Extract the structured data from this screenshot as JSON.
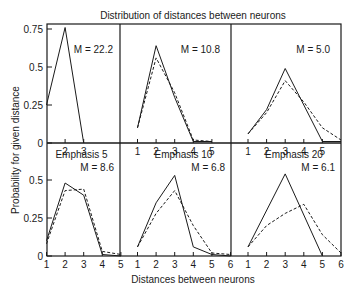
{
  "chart_data": {
    "type": "line",
    "title": "Distribution of distances between neurons",
    "xlabel": "Distances between neurons",
    "ylabel": "Probability for given distance",
    "layout": "2x3 grid of panels, shared axes, no gridlines, no legend",
    "series_styles": {
      "solid": "solid line",
      "dashed": "dashed line"
    },
    "panels": [
      {
        "id": "top-left",
        "row": 0,
        "col": 0,
        "label": "",
        "annotation": "M = 22.2",
        "x_ticks": [
          "2",
          "3"
        ],
        "x_range": [
          1,
          3
        ],
        "y_ticks": [
          "0",
          "0.25",
          "0.5",
          "0.75"
        ],
        "ylim": [
          0,
          0.75
        ],
        "series": [
          {
            "name": "solid",
            "x": [
              1,
              2,
              3
            ],
            "values": [
              0.25,
              0.76,
              0.0
            ]
          }
        ]
      },
      {
        "id": "top-middle",
        "row": 0,
        "col": 1,
        "label": "",
        "annotation": "M = 10.8",
        "x_ticks": [
          "1",
          "2",
          "3",
          "4",
          "5"
        ],
        "x_range": [
          0,
          6
        ],
        "ylim": [
          0,
          0.75
        ],
        "series": [
          {
            "name": "solid",
            "x": [
              1,
              2,
              3,
              4,
              5
            ],
            "values": [
              0.1,
              0.64,
              0.3,
              0.01,
              0.01
            ]
          },
          {
            "name": "dashed",
            "x": [
              1,
              2,
              3,
              4,
              5
            ],
            "values": [
              0.1,
              0.56,
              0.33,
              0.02,
              0.01
            ]
          }
        ]
      },
      {
        "id": "top-right",
        "row": 0,
        "col": 2,
        "label": "",
        "annotation": "M = 5.0",
        "x_ticks": [
          "1",
          "2",
          "3",
          "4",
          "5"
        ],
        "x_range": [
          0,
          6
        ],
        "ylim": [
          0,
          0.75
        ],
        "series": [
          {
            "name": "solid",
            "x": [
              1,
              2,
              3,
              4,
              5,
              6
            ],
            "values": [
              0.06,
              0.22,
              0.49,
              0.25,
              0.01,
              0.01
            ]
          },
          {
            "name": "dashed",
            "x": [
              1,
              2,
              3,
              4,
              5,
              6
            ],
            "values": [
              0.06,
              0.2,
              0.41,
              0.27,
              0.1,
              0.02
            ]
          }
        ]
      },
      {
        "id": "bottom-left",
        "row": 1,
        "col": 0,
        "label": "Emphasis 5",
        "annotation": "M = 8.6",
        "x_ticks": [
          "1",
          "2",
          "3",
          "4",
          "5"
        ],
        "x_range": [
          1,
          5
        ],
        "y_ticks": [
          "0",
          "0.25",
          "0.5"
        ],
        "ylim": [
          0,
          0.75
        ],
        "series": [
          {
            "name": "solid",
            "x": [
              1,
              2,
              3,
              4,
              5
            ],
            "values": [
              0.1,
              0.48,
              0.4,
              0.01,
              0.0
            ]
          },
          {
            "name": "dashed",
            "x": [
              1,
              2,
              3,
              4,
              5
            ],
            "values": [
              0.08,
              0.43,
              0.44,
              0.03,
              0.01
            ]
          }
        ]
      },
      {
        "id": "bottom-middle",
        "row": 1,
        "col": 1,
        "label": "Emphasis 10",
        "annotation": "M = 6.8",
        "x_ticks": [
          "1",
          "2",
          "3",
          "4",
          "5",
          "6"
        ],
        "x_range": [
          0,
          6
        ],
        "ylim": [
          0,
          0.75
        ],
        "series": [
          {
            "name": "solid",
            "x": [
              1,
              2,
              3,
              4,
              5,
              6
            ],
            "values": [
              0.06,
              0.35,
              0.53,
              0.06,
              0.01,
              0.0
            ]
          },
          {
            "name": "dashed",
            "x": [
              1,
              2,
              3,
              4,
              5,
              6
            ],
            "values": [
              0.06,
              0.28,
              0.43,
              0.2,
              0.02,
              0.01
            ]
          }
        ]
      },
      {
        "id": "bottom-right",
        "row": 1,
        "col": 2,
        "label": "Emphasis 20",
        "annotation": "M = 6.1",
        "x_ticks": [
          "1",
          "2",
          "3",
          "4",
          "5",
          "6"
        ],
        "x_range": [
          0,
          6
        ],
        "ylim": [
          0,
          0.75
        ],
        "series": [
          {
            "name": "solid",
            "x": [
              1,
              3,
              5
            ],
            "values": [
              0.06,
              0.54,
              0.0
            ]
          },
          {
            "name": "dashed",
            "x": [
              1,
              2,
              3,
              4,
              5,
              6
            ],
            "values": [
              0.06,
              0.2,
              0.28,
              0.34,
              0.14,
              0.02
            ]
          }
        ]
      }
    ]
  }
}
